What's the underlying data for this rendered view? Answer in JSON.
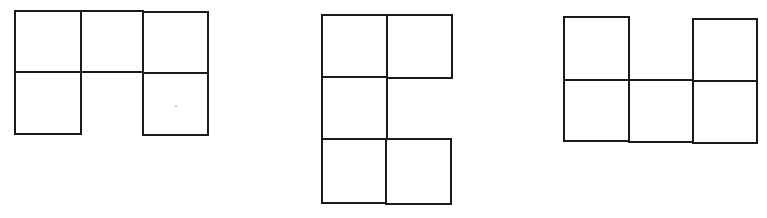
{
  "diagram": {
    "stroke_color": "#1a1a1a",
    "background": "#ffffff",
    "figures": [
      {
        "name": "figure-1",
        "shape": "upside-down U (top row of 3, bottom corners)",
        "grid": {
          "cols": 3,
          "rows": 2
        },
        "cells": [
          [
            0,
            0
          ],
          [
            1,
            0
          ],
          [
            2,
            0
          ],
          [
            0,
            1
          ],
          [
            2,
            1
          ]
        ]
      },
      {
        "name": "figure-2",
        "shape": "C shape (left column of 3, top-right and bottom-right)",
        "grid": {
          "cols": 2,
          "rows": 3
        },
        "cells": [
          [
            0,
            0
          ],
          [
            1,
            0
          ],
          [
            0,
            1
          ],
          [
            0,
            2
          ],
          [
            1,
            2
          ]
        ]
      },
      {
        "name": "figure-3",
        "shape": "U shape (bottom row of 3, top corners)",
        "grid": {
          "cols": 3,
          "rows": 2
        },
        "cells": [
          [
            0,
            0
          ],
          [
            2,
            0
          ],
          [
            0,
            1
          ],
          [
            1,
            1
          ],
          [
            2,
            1
          ]
        ]
      }
    ]
  }
}
